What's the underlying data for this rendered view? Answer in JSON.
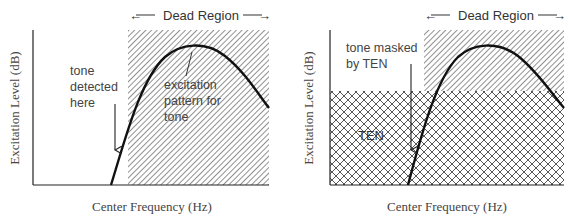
{
  "colors": {
    "ink": "#1a1a1a",
    "hatch": "#555555",
    "label": "#444444"
  },
  "left_panel": {
    "dead_region_label": "Dead Region",
    "arrow_left": "←",
    "arrow_right": "→",
    "tone_detected": [
      "tone",
      "detected",
      "here"
    ],
    "excitation_pattern": [
      "excitation",
      "pattern for",
      "tone"
    ],
    "ylabel": "Excitation Level (dB)",
    "xlabel": "Center Frequency (Hz)"
  },
  "right_panel": {
    "dead_region_label": "Dead Region",
    "arrow_left": "←",
    "arrow_right": "→",
    "tone_masked": [
      "tone masked",
      "by TEN"
    ],
    "ten_label": "TEN",
    "ylabel": "Excitation Level (dB)",
    "xlabel": "Center Frequency (Hz)"
  }
}
